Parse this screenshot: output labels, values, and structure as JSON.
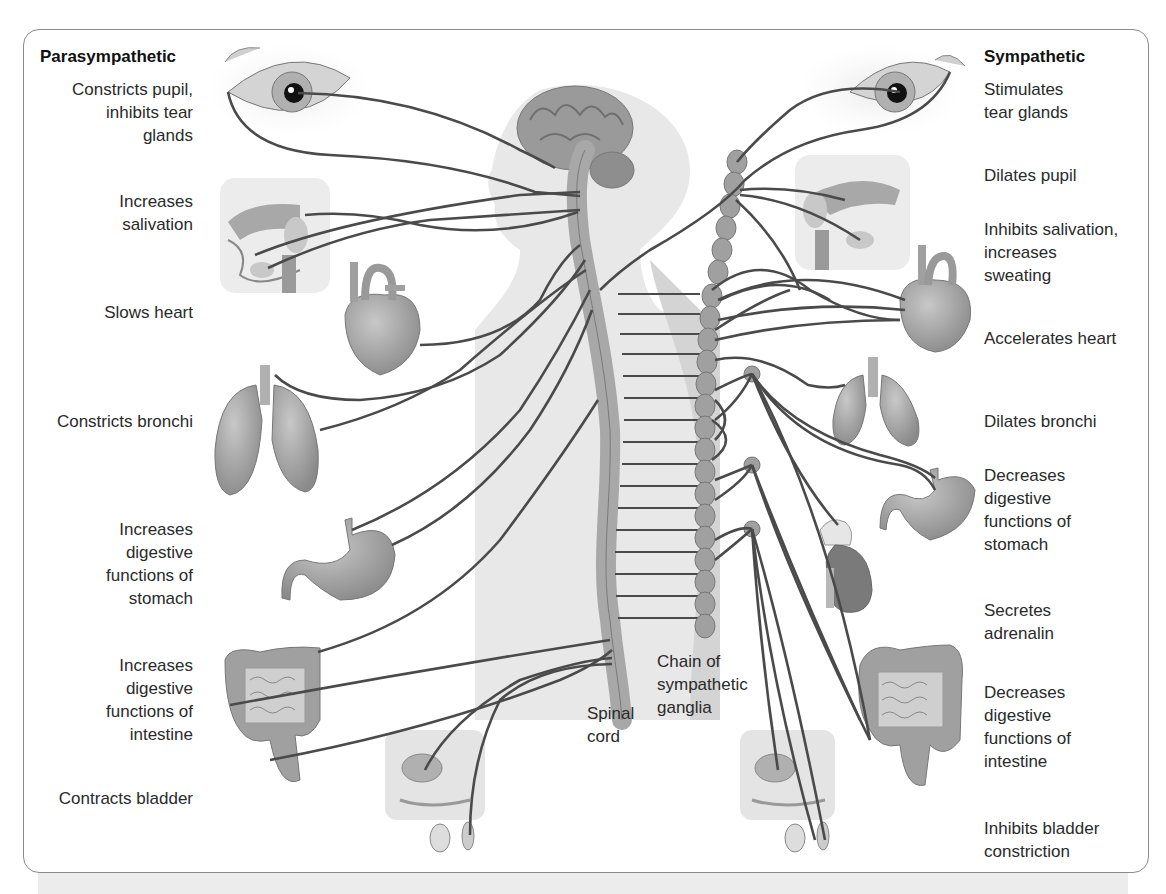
{
  "diagram": {
    "title_left": "Parasympathetic",
    "title_right": "Sympathetic",
    "parasympathetic": [
      {
        "organ": "eye",
        "effect": "Constricts pupil,\ninhibits tear\nglands"
      },
      {
        "organ": "salivary-glands",
        "effect": "Increases\nsalivation"
      },
      {
        "organ": "heart",
        "effect": "Slows heart"
      },
      {
        "organ": "lungs",
        "effect": "Constricts bronchi"
      },
      {
        "organ": "stomach",
        "effect": "Increases\ndigestive\nfunctions of\nstomach"
      },
      {
        "organ": "intestine",
        "effect": "Increases\ndigestive\nfunctions of\nintestine"
      },
      {
        "organ": "bladder",
        "effect": "Contracts bladder"
      }
    ],
    "sympathetic": [
      {
        "organ": "tear-glands",
        "effect": "Stimulates\ntear glands"
      },
      {
        "organ": "eye",
        "effect": "Dilates pupil"
      },
      {
        "organ": "salivary-glands",
        "effect": "Inhibits salivation,\nincreases\nsweating"
      },
      {
        "organ": "heart",
        "effect": "Accelerates heart"
      },
      {
        "organ": "lungs",
        "effect": "Dilates bronchi"
      },
      {
        "organ": "stomach",
        "effect": "Decreases\ndigestive\nfunctions of\nstomach"
      },
      {
        "organ": "adrenal",
        "effect": "Secretes\nadrenalin"
      },
      {
        "organ": "intestine",
        "effect": "Decreases\ndigestive\nfunctions of\nintestine"
      },
      {
        "organ": "bladder",
        "effect": "Inhibits bladder\nconstriction"
      }
    ],
    "center_labels": {
      "spinal_cord": "Spinal\ncord",
      "ganglia_chain": "Chain of\nsympathetic\nganglia"
    },
    "colors": {
      "nerve": "#4a4a4a",
      "organ_fill": "#9a9a9a",
      "body_fill": "#e6e6e6",
      "frame": "#8a8a8a"
    }
  }
}
